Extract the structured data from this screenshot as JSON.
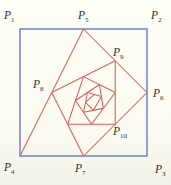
{
  "figure": {
    "background": "#fcfbf1",
    "square": {
      "color": "#7082c9",
      "stroke_width": 1.5,
      "corner_ids": [
        "P1",
        "P2",
        "P3",
        "P4"
      ]
    },
    "spiral": {
      "color": "#d95f60",
      "stroke_width": 1.05,
      "path_ids": [
        "P4",
        "P5",
        "P6",
        "P7",
        "P8",
        "P9",
        "P10",
        "P11",
        "P12",
        "P13",
        "P14",
        "P15",
        "P16",
        "P17",
        "P18",
        "P19",
        "P20",
        "P21",
        "P22",
        "P23"
      ]
    },
    "points": [
      {
        "id": "P1",
        "x": 20,
        "y": 29
      },
      {
        "id": "P2",
        "x": 147,
        "y": 29
      },
      {
        "id": "P3",
        "x": 147,
        "y": 156
      },
      {
        "id": "P4",
        "x": 20,
        "y": 156
      },
      {
        "id": "P5",
        "x": 83.5,
        "y": 29
      },
      {
        "id": "P6",
        "x": 147,
        "y": 92.5
      },
      {
        "id": "P7",
        "x": 83.5,
        "y": 156
      },
      {
        "id": "P8",
        "x": 51.75,
        "y": 92.5
      },
      {
        "id": "P9",
        "x": 115.25,
        "y": 60.75
      },
      {
        "id": "P10",
        "x": 115.25,
        "y": 124.25
      },
      {
        "id": "P11",
        "x": 67.63,
        "y": 124.25
      },
      {
        "id": "P12",
        "x": 83.5,
        "y": 76.63
      },
      {
        "id": "P13",
        "x": 115.25,
        "y": 92.5
      },
      {
        "id": "P14",
        "x": 91.44,
        "y": 124.25
      },
      {
        "id": "P15",
        "x": 75.56,
        "y": 100.44
      },
      {
        "id": "P16",
        "x": 99.38,
        "y": 84.56
      },
      {
        "id": "P17",
        "x": 103.34,
        "y": 108.38
      },
      {
        "id": "P18",
        "x": 83.5,
        "y": 112.34
      },
      {
        "id": "P19",
        "x": 87.47,
        "y": 92.5
      },
      {
        "id": "P20",
        "x": 101.36,
        "y": 96.47
      },
      {
        "id": "P21",
        "x": 93.42,
        "y": 110.36
      },
      {
        "id": "P22",
        "x": 85.48,
        "y": 102.42
      },
      {
        "id": "P23",
        "x": 94.41,
        "y": 94.48
      }
    ],
    "labels": [
      {
        "id": "P1",
        "base": "P",
        "sub": "1",
        "x": 4,
        "y": 19
      },
      {
        "id": "P2",
        "base": "P",
        "sub": "2",
        "x": 151,
        "y": 19
      },
      {
        "id": "P3",
        "base": "P",
        "sub": "3",
        "x": 155,
        "y": 173
      },
      {
        "id": "P4",
        "base": "P",
        "sub": "4",
        "x": 4,
        "y": 171
      },
      {
        "id": "P5",
        "base": "P",
        "sub": "5",
        "x": 78,
        "y": 19
      },
      {
        "id": "P6",
        "base": "P",
        "sub": "6",
        "x": 153,
        "y": 97
      },
      {
        "id": "P7",
        "base": "P",
        "sub": "7",
        "x": 75,
        "y": 172
      },
      {
        "id": "P8",
        "base": "P",
        "sub": "8",
        "x": 33,
        "y": 88
      },
      {
        "id": "P9",
        "base": "P",
        "sub": "9",
        "x": 113,
        "y": 56
      },
      {
        "id": "P10",
        "base": "P",
        "sub": "10",
        "x": 113,
        "y": 135
      }
    ],
    "label_style": {
      "color": "#2f2f2f",
      "font_size": 11.5,
      "sub_font_size": 7,
      "sub_dy": 2.5
    }
  }
}
